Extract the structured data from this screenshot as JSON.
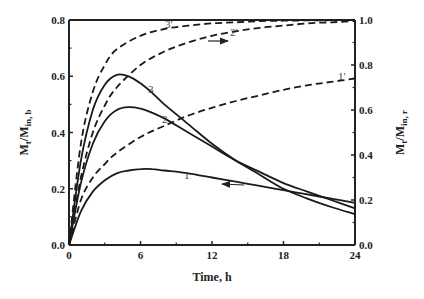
{
  "chart_data": {
    "type": "line",
    "title": "",
    "xlabel": "Time, h",
    "ylabel_left": "Mt/Min, b",
    "ylabel_right": "Mt/Min, r",
    "xlim": [
      0,
      24
    ],
    "ylim_left": [
      0.0,
      0.8
    ],
    "ylim_right": [
      0.0,
      1.0
    ],
    "x_ticks": [
      "0",
      "6",
      "12",
      "18",
      "24"
    ],
    "y_ticks_left": [
      "0.0",
      "0.2",
      "0.4",
      "0.6",
      "0.8"
    ],
    "y_ticks_right": [
      "0.0",
      "0.2",
      "0.4",
      "0.6",
      "0.8",
      "1.0"
    ],
    "grid": false,
    "legend": "inline curve labels with arrows pointing to axis",
    "series": [
      {
        "name": "1",
        "axis": "left",
        "style": "solid",
        "x": [
          0,
          1,
          2,
          3,
          4,
          5,
          6,
          7,
          8,
          10,
          12,
          14,
          16,
          18,
          20,
          22,
          24
        ],
        "y": [
          0,
          0.12,
          0.19,
          0.23,
          0.255,
          0.265,
          0.27,
          0.27,
          0.265,
          0.255,
          0.24,
          0.225,
          0.21,
          0.195,
          0.18,
          0.165,
          0.15
        ]
      },
      {
        "name": "2",
        "axis": "left",
        "style": "solid",
        "x": [
          0,
          1,
          2,
          3,
          4,
          5,
          6,
          7,
          8,
          10,
          12,
          14,
          16,
          18,
          20,
          22,
          24
        ],
        "y": [
          0,
          0.22,
          0.36,
          0.44,
          0.48,
          0.49,
          0.485,
          0.47,
          0.45,
          0.4,
          0.35,
          0.3,
          0.26,
          0.22,
          0.19,
          0.16,
          0.13
        ]
      },
      {
        "name": "3",
        "axis": "left",
        "style": "solid",
        "x": [
          0,
          1,
          2,
          3,
          4,
          5,
          6,
          7,
          8,
          10,
          12,
          14,
          16,
          18,
          20,
          22,
          24
        ],
        "y": [
          0,
          0.3,
          0.48,
          0.57,
          0.605,
          0.6,
          0.575,
          0.54,
          0.5,
          0.43,
          0.36,
          0.3,
          0.25,
          0.2,
          0.165,
          0.135,
          0.11
        ]
      },
      {
        "name": "1'",
        "axis": "right",
        "style": "dashed",
        "x": [
          0,
          1,
          2,
          3,
          4,
          6,
          8,
          10,
          12,
          14,
          16,
          18,
          20,
          22,
          24
        ],
        "y": [
          0,
          0.2,
          0.3,
          0.36,
          0.41,
          0.48,
          0.53,
          0.575,
          0.61,
          0.64,
          0.665,
          0.69,
          0.71,
          0.725,
          0.74
        ]
      },
      {
        "name": "2'",
        "axis": "right",
        "style": "dashed",
        "x": [
          0,
          1,
          2,
          3,
          4,
          6,
          8,
          10,
          12,
          14,
          16,
          18,
          20,
          22,
          24
        ],
        "y": [
          0,
          0.3,
          0.5,
          0.62,
          0.7,
          0.8,
          0.86,
          0.9,
          0.93,
          0.95,
          0.965,
          0.975,
          0.985,
          0.99,
          0.995
        ]
      },
      {
        "name": "3'",
        "axis": "right",
        "style": "dashed",
        "x": [
          0,
          1,
          2,
          3,
          4,
          6,
          8,
          10,
          12,
          14,
          16,
          18,
          20,
          22,
          24
        ],
        "y": [
          0,
          0.45,
          0.68,
          0.8,
          0.87,
          0.93,
          0.96,
          0.975,
          0.985,
          0.99,
          0.995,
          0.997,
          0.998,
          0.999,
          1.0
        ]
      }
    ],
    "annotations": [
      {
        "text": "1",
        "arrow": "points left toward left axis"
      },
      {
        "text": "2'",
        "arrow": "points right toward right axis"
      },
      {
        "text": "1'"
      },
      {
        "text": "2"
      },
      {
        "text": "3"
      },
      {
        "text": "3'"
      }
    ]
  }
}
